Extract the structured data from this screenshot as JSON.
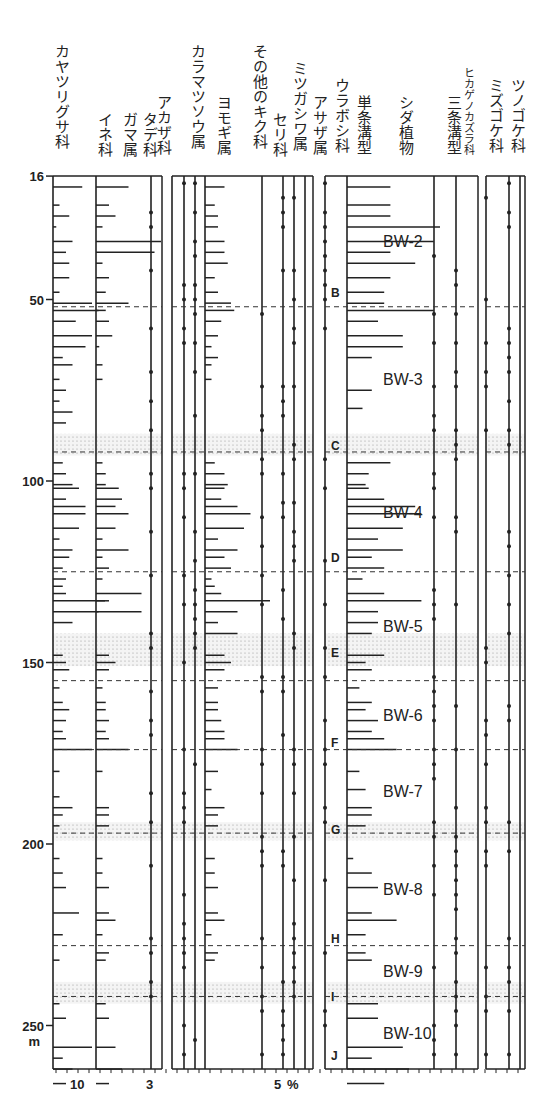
{
  "chart_data": {
    "type": "pollen-diagram",
    "title": "",
    "ylabel": "m",
    "depth_axis": {
      "ticks": [
        16,
        50,
        100,
        150,
        200,
        250
      ],
      "unit": "m",
      "range": [
        16,
        262
      ]
    },
    "x_axis_labels": [
      {
        "text": "10",
        "panel": 1
      },
      {
        "text": "3",
        "panel": 1
      },
      {
        "text": "5",
        "panel": 2
      },
      {
        "text": "%",
        "panel": 2
      }
    ],
    "taxa": [
      {
        "name": "カヤツリグサ科",
        "panel": 1
      },
      {
        "name": "イネ科",
        "panel": 1
      },
      {
        "name": "ガマ属",
        "panel": 1
      },
      {
        "name": "タデ科",
        "panel": 2
      },
      {
        "name": "アカザ科",
        "panel": 2
      },
      {
        "name": "カラマツソウ属",
        "panel": 2
      },
      {
        "name": "ヨモギ属",
        "panel": 2
      },
      {
        "name": "その他のキク科",
        "panel": 2
      },
      {
        "name": "セリ科",
        "panel": 2
      },
      {
        "name": "ミツガシワ属",
        "panel": 2
      },
      {
        "name": "アサザ属",
        "panel": 2
      },
      {
        "name": "ウラボシ科",
        "panel": 3
      },
      {
        "name": "単条溝型",
        "panel": 3
      },
      {
        "name": "シダ植物",
        "panel": 3
      },
      {
        "name": "三条溝型",
        "panel": 3
      },
      {
        "name": "ヒカゲノカズラ科",
        "panel": 3
      },
      {
        "name": "ミズゴケ科",
        "panel": 4
      },
      {
        "name": "ツノゴケ科",
        "panel": 4
      }
    ],
    "zones": [
      {
        "label": "BW-2",
        "top": 16,
        "bottom": 52
      },
      {
        "label": "BW-3",
        "top": 52,
        "bottom": 92
      },
      {
        "label": "BW-4",
        "top": 92,
        "bottom": 125
      },
      {
        "label": "BW-5",
        "top": 125,
        "bottom": 155
      },
      {
        "label": "BW-6",
        "top": 155,
        "bottom": 174
      },
      {
        "label": "BW-7",
        "top": 174,
        "bottom": 197
      },
      {
        "label": "BW-8",
        "top": 197,
        "bottom": 228
      },
      {
        "label": "BW-9",
        "top": 228,
        "bottom": 242
      },
      {
        "label": "BW-10",
        "top": 242,
        "bottom": 262
      }
    ],
    "zone_boundaries_m": [
      52,
      92,
      125,
      155,
      174,
      197,
      228,
      242
    ],
    "shaded_bands_m": [
      [
        87,
        93
      ],
      [
        142,
        151
      ],
      [
        194,
        199
      ],
      [
        238,
        244
      ]
    ],
    "tephra_markers": [
      {
        "label": "B",
        "depth": 48
      },
      {
        "label": "C",
        "depth": 90
      },
      {
        "label": "D",
        "depth": 121
      },
      {
        "label": "E",
        "depth": 147
      },
      {
        "label": "F",
        "depth": 172
      },
      {
        "label": "G",
        "depth": 196
      },
      {
        "label": "H",
        "depth": 226
      },
      {
        "label": "I",
        "depth": 242
      },
      {
        "label": "J",
        "depth": 258
      }
    ],
    "samples": {
      "カヤツリグサ科": [
        [
          19,
          4.5
        ],
        [
          24,
          1
        ],
        [
          27,
          2.5
        ],
        [
          30,
          0.5
        ],
        [
          34,
          3
        ],
        [
          37,
          2
        ],
        [
          40,
          2.5
        ],
        [
          44,
          2.5
        ],
        [
          48,
          1
        ],
        [
          51,
          6
        ],
        [
          53,
          7
        ],
        [
          56,
          3.5
        ],
        [
          60,
          6
        ],
        [
          63,
          5
        ],
        [
          66,
          1.5
        ],
        [
          68,
          3
        ],
        [
          72,
          1
        ],
        [
          75,
          2
        ],
        [
          78,
          1
        ],
        [
          81,
          3
        ],
        [
          84,
          2
        ],
        [
          95,
          1.5
        ],
        [
          98,
          2
        ],
        [
          101,
          3
        ],
        [
          102,
          4
        ],
        [
          105,
          2
        ],
        [
          107,
          5
        ],
        [
          109,
          5
        ],
        [
          113,
          4
        ],
        [
          116,
          1
        ],
        [
          119,
          3
        ],
        [
          121,
          2.5
        ],
        [
          124,
          1.5
        ],
        [
          127,
          2
        ],
        [
          129,
          1.5
        ],
        [
          131,
          2
        ],
        [
          133,
          8
        ],
        [
          136,
          7
        ],
        [
          139,
          3
        ],
        [
          148,
          1.5
        ],
        [
          150,
          2
        ],
        [
          152,
          2.5
        ],
        [
          157,
          1
        ],
        [
          161,
          1.5
        ],
        [
          163,
          2.5
        ],
        [
          166,
          2
        ],
        [
          169,
          1.5
        ],
        [
          171,
          2
        ],
        [
          174,
          6
        ],
        [
          180,
          1
        ],
        [
          187,
          1
        ],
        [
          190,
          3
        ],
        [
          192,
          1.5
        ],
        [
          195,
          1
        ],
        [
          204,
          1
        ],
        [
          208,
          1.5
        ],
        [
          212,
          2
        ],
        [
          219,
          4
        ],
        [
          225,
          1.5
        ],
        [
          232,
          1
        ],
        [
          244,
          1
        ],
        [
          248,
          2
        ],
        [
          256,
          6
        ],
        [
          259,
          1.5
        ],
        [
          262,
          3
        ],
        [
          266,
          2
        ]
      ],
      "イネ科": [
        [
          19,
          5
        ],
        [
          24,
          2
        ],
        [
          27,
          3
        ],
        [
          30,
          1
        ],
        [
          34,
          10
        ],
        [
          37,
          9
        ],
        [
          40,
          1
        ],
        [
          44,
          2
        ],
        [
          48,
          1.5
        ],
        [
          51,
          5
        ],
        [
          53,
          1.5
        ],
        [
          56,
          2
        ],
        [
          60,
          2.5
        ],
        [
          63,
          0.5
        ],
        [
          68,
          1
        ],
        [
          72,
          1
        ],
        [
          95,
          1
        ],
        [
          98,
          1.5
        ],
        [
          101,
          1.5
        ],
        [
          102,
          3.5
        ],
        [
          105,
          4
        ],
        [
          107,
          3
        ],
        [
          109,
          5
        ],
        [
          113,
          3
        ],
        [
          116,
          1
        ],
        [
          119,
          5
        ],
        [
          121,
          1
        ],
        [
          124,
          2
        ],
        [
          127,
          1
        ],
        [
          131,
          7
        ],
        [
          133,
          2
        ],
        [
          136,
          7
        ],
        [
          148,
          2
        ],
        [
          150,
          3
        ],
        [
          152,
          2
        ],
        [
          157,
          1
        ],
        [
          161,
          1.5
        ],
        [
          163,
          1.5
        ],
        [
          166,
          2
        ],
        [
          169,
          1.5
        ],
        [
          171,
          2
        ],
        [
          174,
          5
        ],
        [
          180,
          1
        ],
        [
          190,
          2
        ],
        [
          192,
          2
        ],
        [
          195,
          2
        ],
        [
          204,
          1
        ],
        [
          208,
          1
        ],
        [
          212,
          2
        ],
        [
          219,
          2
        ],
        [
          221,
          3
        ],
        [
          225,
          1
        ],
        [
          230,
          2
        ],
        [
          232,
          1.5
        ],
        [
          244,
          1.5
        ],
        [
          248,
          2
        ],
        [
          256,
          3
        ],
        [
          262,
          4
        ],
        [
          266,
          2
        ]
      ],
      "ヨモギ属": [
        [
          19,
          3
        ],
        [
          24,
          1.5
        ],
        [
          27,
          2
        ],
        [
          30,
          2
        ],
        [
          34,
          3
        ],
        [
          37,
          3
        ],
        [
          40,
          3.5
        ],
        [
          44,
          1.5
        ],
        [
          48,
          2
        ],
        [
          51,
          4
        ],
        [
          53,
          4.5
        ],
        [
          56,
          2.5
        ],
        [
          60,
          2
        ],
        [
          63,
          1
        ],
        [
          66,
          2
        ],
        [
          68,
          1
        ],
        [
          72,
          1
        ],
        [
          95,
          1.5
        ],
        [
          98,
          3
        ],
        [
          101,
          3.5
        ],
        [
          102,
          3
        ],
        [
          105,
          2.5
        ],
        [
          107,
          5
        ],
        [
          109,
          7
        ],
        [
          113,
          6
        ],
        [
          116,
          2
        ],
        [
          119,
          5
        ],
        [
          121,
          3
        ],
        [
          124,
          4
        ],
        [
          127,
          1
        ],
        [
          129,
          1.5
        ],
        [
          131,
          2.5
        ],
        [
          133,
          10
        ],
        [
          136,
          5
        ],
        [
          139,
          2
        ],
        [
          142,
          5
        ],
        [
          148,
          3
        ],
        [
          150,
          4
        ],
        [
          152,
          3
        ],
        [
          157,
          2
        ],
        [
          161,
          2
        ],
        [
          163,
          2
        ],
        [
          166,
          2.5
        ],
        [
          169,
          3
        ],
        [
          171,
          3
        ],
        [
          174,
          5
        ],
        [
          180,
          2
        ],
        [
          185,
          1
        ],
        [
          190,
          3
        ],
        [
          192,
          2
        ],
        [
          195,
          2
        ],
        [
          204,
          1.5
        ],
        [
          208,
          1.5
        ],
        [
          212,
          2
        ],
        [
          219,
          2
        ],
        [
          221,
          3
        ],
        [
          225,
          1
        ],
        [
          230,
          2
        ],
        [
          232,
          1.5
        ]
      ],
      "単条溝型": [
        [
          19,
          7
        ],
        [
          24,
          7
        ],
        [
          27,
          7
        ],
        [
          30,
          15
        ],
        [
          34,
          14
        ],
        [
          37,
          7
        ],
        [
          40,
          11
        ],
        [
          44,
          7
        ],
        [
          48,
          6
        ],
        [
          51,
          6
        ],
        [
          53,
          14
        ],
        [
          56,
          5
        ],
        [
          60,
          9
        ],
        [
          63,
          9
        ],
        [
          66,
          4
        ],
        [
          75,
          4
        ],
        [
          80,
          2.5
        ],
        [
          95,
          7
        ],
        [
          98,
          3.5
        ],
        [
          101,
          3
        ],
        [
          102,
          3.5
        ],
        [
          105,
          6
        ],
        [
          107,
          11
        ],
        [
          109,
          12
        ],
        [
          113,
          9
        ],
        [
          116,
          5
        ],
        [
          119,
          9
        ],
        [
          121,
          4
        ],
        [
          124,
          6
        ],
        [
          127,
          2.5
        ],
        [
          131,
          6
        ],
        [
          133,
          12
        ],
        [
          136,
          5
        ],
        [
          139,
          5
        ],
        [
          142,
          4
        ],
        [
          148,
          6
        ],
        [
          150,
          3
        ],
        [
          152,
          4
        ],
        [
          157,
          2
        ],
        [
          161,
          4
        ],
        [
          163,
          3
        ],
        [
          166,
          5
        ],
        [
          169,
          4
        ],
        [
          171,
          6
        ],
        [
          174,
          8
        ],
        [
          180,
          2
        ],
        [
          185,
          3
        ],
        [
          190,
          4
        ],
        [
          192,
          4
        ],
        [
          195,
          3
        ],
        [
          204,
          1
        ],
        [
          208,
          4
        ],
        [
          212,
          5
        ],
        [
          219,
          4
        ],
        [
          221,
          8
        ],
        [
          225,
          3
        ],
        [
          230,
          3
        ],
        [
          232,
          4
        ],
        [
          244,
          5
        ],
        [
          248,
          5
        ],
        [
          256,
          9
        ],
        [
          259,
          4
        ],
        [
          262,
          10
        ],
        [
          266,
          6
        ]
      ]
    }
  }
}
